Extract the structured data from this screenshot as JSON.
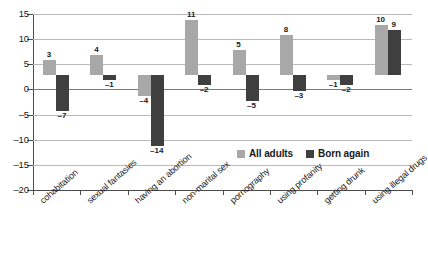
{
  "chart_data": {
    "type": "bar",
    "title": "",
    "subtitle": "",
    "xlabel": "",
    "ylabel": "",
    "ylim": [
      -20,
      15
    ],
    "yticks": [
      15,
      10,
      5,
      0,
      -5,
      -10,
      -15,
      -20
    ],
    "ytick_labels": [
      "15",
      "10",
      "5",
      "0",
      "–5",
      "–10",
      "–15",
      "–20"
    ],
    "grid": true,
    "legend_position": "inside-lower-right",
    "categories": [
      "cohabitation",
      "sexual fantasies",
      "having an abortion",
      "non-marital sex",
      "pornography",
      "using profanity",
      "getting drunk",
      "using illegal drugs"
    ],
    "series": [
      {
        "name": "All adults",
        "color": "#a8a8a8",
        "values": [
          3,
          4,
          -4,
          11,
          5,
          8,
          -1,
          10
        ],
        "labels": [
          "3",
          "4",
          "–4",
          "11",
          "5",
          "8",
          "–1",
          "10"
        ]
      },
      {
        "name": "Born again",
        "color": "#3f3f3f",
        "values": [
          -7,
          -1,
          -14,
          -2,
          -5,
          -3,
          -2,
          9
        ],
        "labels": [
          "–7",
          "–1",
          "–14",
          "–2",
          "–5",
          "–3",
          "–2",
          "9"
        ]
      }
    ]
  },
  "legend": {
    "items": [
      {
        "label": "All adults",
        "color": "#a8a8a8"
      },
      {
        "label": "Born again",
        "color": "#3f3f3f"
      }
    ]
  },
  "colors": {
    "all_adults": "#a8a8a8",
    "born_again": "#3f3f3f",
    "gridline": "#b9b9b9",
    "axis": "#4d4d4d",
    "background": "#ffffff"
  }
}
